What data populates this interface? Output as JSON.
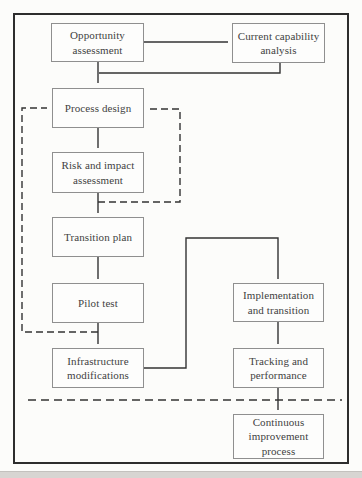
{
  "figure": {
    "type": "flowchart",
    "title": ""
  },
  "nodes": {
    "opportunity": {
      "label": "Opportunity\nassessment"
    },
    "capability": {
      "label": "Current capability\nanalysis"
    },
    "process": {
      "label": "Process design"
    },
    "risk": {
      "label": "Risk and impact\nassessment"
    },
    "transition": {
      "label": "Transition plan"
    },
    "pilot": {
      "label": "Pilot test"
    },
    "infrastructure": {
      "label": "Infrastructure\nmodifications"
    },
    "implementation": {
      "label": "Implementation\nand transition"
    },
    "tracking": {
      "label": "Tracking and\nperformance"
    },
    "continuous": {
      "label": "Continuous\nimprovement\nprocess"
    }
  },
  "edges": [
    {
      "from": "opportunity",
      "to": "capability",
      "style": "solid"
    },
    {
      "from": "opportunity",
      "to": "process",
      "style": "solid"
    },
    {
      "from": "capability",
      "to": "process",
      "style": "solid"
    },
    {
      "from": "process",
      "to": "risk",
      "style": "solid"
    },
    {
      "from": "risk",
      "to": "transition",
      "style": "solid"
    },
    {
      "from": "transition",
      "to": "pilot",
      "style": "solid"
    },
    {
      "from": "pilot",
      "to": "infrastructure",
      "style": "solid"
    },
    {
      "from": "infrastructure",
      "to": "implementation",
      "style": "solid"
    },
    {
      "from": "implementation",
      "to": "tracking",
      "style": "solid"
    },
    {
      "from": "tracking",
      "to": "continuous",
      "style": "solid"
    },
    {
      "from": "pilot",
      "to": "process",
      "style": "dashed"
    },
    {
      "from": "risk",
      "to": "process",
      "style": "dashed"
    },
    {
      "from": "divider",
      "to": "divider",
      "style": "dashed"
    }
  ],
  "colors": {
    "line": "#333333",
    "arrowhead": "#2f2f2f",
    "box_border": "#8f8f8f",
    "text": "#424242",
    "outer_border": "#2d2d2d",
    "background": "#fcfcfa",
    "footer_strip": "#d7d5d2"
  }
}
